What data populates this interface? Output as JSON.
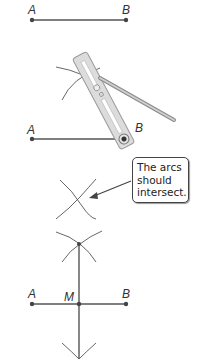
{
  "figure": {
    "steps": [
      {
        "id": "step-1",
        "labels": {
          "a": "A",
          "b": "B"
        }
      },
      {
        "id": "step-2",
        "labels": {
          "a": "A",
          "b": "B"
        },
        "tool": "compass"
      },
      {
        "id": "step-3",
        "callout": {
          "lines": [
            "The arcs",
            "should",
            "intersect."
          ]
        }
      },
      {
        "id": "step-4",
        "labels": {
          "a": "A",
          "m": "M",
          "b": "B"
        }
      }
    ],
    "colors": {
      "line": "#555555",
      "point": "#444444",
      "compass": "#d9d9d9",
      "compass_edge": "#9a9a9a"
    }
  }
}
